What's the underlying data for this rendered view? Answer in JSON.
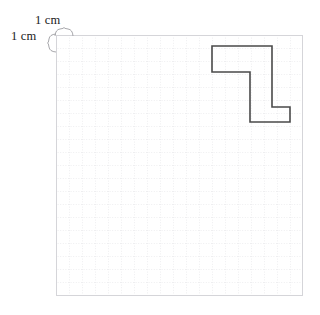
{
  "figure": {
    "type": "geometry-grid-figure",
    "background_color": "#ffffff",
    "unit_label_top": "1 cm",
    "unit_label_left": "1 cm",
    "unit_description": "Each grid square measures 1 cm by 1 cm"
  },
  "grid": {
    "name": "centimetre-grid",
    "columns": 19,
    "rows": 20,
    "cell_size_px": 13,
    "origin_x_px": 56,
    "origin_y_px": 35,
    "width_px": 247,
    "height_px": 261,
    "line_color": "#d8d8dc",
    "dotted_line_color": "#dcdce0",
    "border_color": "#d4d4d8",
    "grid_style": "dotted"
  },
  "braces": {
    "top": {
      "name": "top-unit-brace",
      "label": "1 cm",
      "spans_cells": 1,
      "color": "#9a9a9a"
    },
    "left": {
      "name": "left-unit-brace",
      "label": "1 cm",
      "spans_cells": 1,
      "color": "#9a9a9a"
    }
  },
  "shape": {
    "name": "z-shaped-polygon",
    "description": "Z / S shaped rectilinear octagon outlined on the centimetre grid",
    "stroke_color": "#4a4a4a",
    "stroke_width_px": 1.6,
    "fill": "none",
    "vertex_count": 8,
    "vertices_px": [
      [
        212,
        46
      ],
      [
        272,
        46
      ],
      [
        272,
        107
      ],
      [
        290,
        107
      ],
      [
        290,
        122
      ],
      [
        250,
        122
      ],
      [
        250,
        72
      ],
      [
        212,
        72
      ]
    ],
    "vertices_cm": [
      [
        12,
        1
      ],
      [
        17,
        1
      ],
      [
        17,
        6
      ],
      [
        18,
        6
      ],
      [
        18,
        7
      ],
      [
        15,
        7
      ],
      [
        15,
        3
      ],
      [
        12,
        3
      ]
    ],
    "path_d": "M 212 46 L 272 46 L 272 107 L 290 107 L 290 122 L 250 122 L 250 72 L 212 72 Z"
  },
  "chart_data": {
    "type": "table",
    "title": "",
    "xlabel": "1 cm",
    "ylabel": "1 cm",
    "categories": [
      "grid_columns",
      "grid_rows",
      "cell_size_cm",
      "shape_vertices"
    ],
    "values": [
      19,
      20,
      1,
      8
    ]
  }
}
